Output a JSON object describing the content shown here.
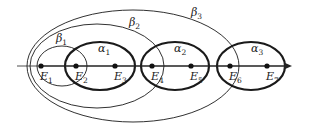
{
  "diagram": {
    "axis": {
      "x1": 17,
      "x2": 292,
      "y": 66,
      "color": "#222222"
    },
    "points": [
      {
        "id": "E1",
        "label": "E",
        "sub": "1",
        "x": 41,
        "y": 66
      },
      {
        "id": "E2",
        "label": "E",
        "sub": "2",
        "x": 76,
        "y": 66
      },
      {
        "id": "E3",
        "label": "E",
        "sub": "3",
        "x": 115,
        "y": 66
      },
      {
        "id": "E4",
        "label": "E",
        "sub": "4",
        "x": 152,
        "y": 66
      },
      {
        "id": "E5",
        "label": "E",
        "sub": "5",
        "x": 191,
        "y": 66
      },
      {
        "id": "E6",
        "label": "E",
        "sub": "6",
        "x": 230,
        "y": 66
      },
      {
        "id": "E7",
        "label": "E",
        "sub": "7",
        "x": 267,
        "y": 66
      }
    ],
    "alpha_sets": [
      {
        "id": "alpha1",
        "label": "α",
        "sub": "1",
        "cx": 100,
        "cy": 66,
        "rx": 35,
        "ry": 24,
        "lx": 102,
        "ly": 52
      },
      {
        "id": "alpha2",
        "label": "α",
        "sub": "2",
        "cx": 175,
        "cy": 66,
        "rx": 34,
        "ry": 24,
        "lx": 178,
        "ly": 52
      },
      {
        "id": "alpha3",
        "label": "α",
        "sub": "3",
        "cx": 251,
        "cy": 66,
        "rx": 34,
        "ry": 24,
        "lx": 255,
        "ly": 52
      }
    ],
    "beta_sets": [
      {
        "id": "beta1",
        "label": "β",
        "sub": "1",
        "cx": 62,
        "cy": 66,
        "rx": 25,
        "ry": 20,
        "lx": 60,
        "ly": 42
      },
      {
        "id": "beta2",
        "label": "β",
        "sub": "2",
        "cx": 97,
        "cy": 66,
        "rx": 67,
        "ry": 42,
        "lx": 133,
        "ly": 26
      },
      {
        "id": "beta3",
        "label": "β",
        "sub": "3",
        "cx": 133,
        "cy": 66,
        "rx": 106,
        "ry": 56,
        "lx": 195,
        "ly": 16
      }
    ],
    "stroke": "#1a1a1a"
  }
}
